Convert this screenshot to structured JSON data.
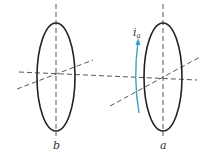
{
  "diagram": {
    "loops": [
      {
        "id": "b",
        "label": "b",
        "cx": 56,
        "cy": 77,
        "rx": 19,
        "ry": 54
      },
      {
        "id": "a",
        "label": "a",
        "cx": 163,
        "cy": 77,
        "rx": 19,
        "ry": 54
      }
    ],
    "current": {
      "symbol": "i",
      "subscript": "a",
      "color": "#3aa0c8"
    },
    "colors": {
      "loop": "#222222",
      "axis": "#444444",
      "arrow": "#3aa0c8"
    }
  }
}
